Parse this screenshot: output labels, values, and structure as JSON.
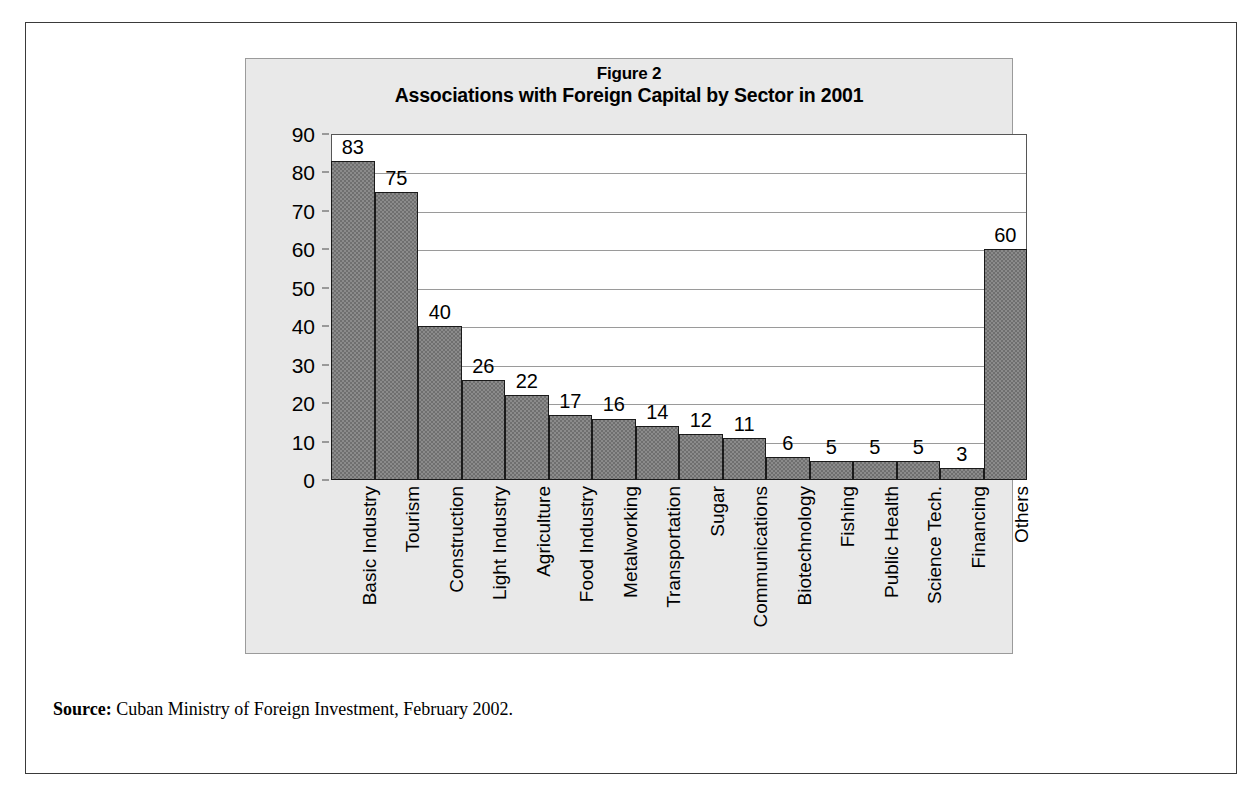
{
  "figure": {
    "number_label": "Figure 2",
    "title": "Associations with Foreign Capital by Sector in 2001"
  },
  "source": {
    "label": "Source:",
    "text": " Cuban Ministry of Foreign Investment, February 2002."
  },
  "colors": {
    "bar_fill": "#8b8b8b",
    "bar_stroke": "#1a1a1a",
    "panel_background": "#e9e9e9",
    "plot_background": "#ffffff",
    "gridline": "#9a9a9a",
    "frame": "#3a3a3a",
    "text": "#000000"
  },
  "chart_data": {
    "type": "bar",
    "title": "Associations with Foreign Capital by Sector in 2001",
    "subtitle": "Figure 2",
    "xlabel": "",
    "ylabel": "",
    "ylim": [
      0,
      90
    ],
    "ytick_step": 10,
    "yticks": [
      0,
      10,
      20,
      30,
      40,
      50,
      60,
      70,
      80,
      90
    ],
    "ytick_labels": [
      "0",
      "10",
      "20",
      "30",
      "40",
      "50",
      "60",
      "70",
      "80",
      "90"
    ],
    "grid": true,
    "grid_axis": "y",
    "legend": false,
    "legend_position": "none",
    "show_value_labels": true,
    "bar_gap": 0,
    "categories": [
      "Basic Industry",
      "Tourism",
      "Construction",
      "Light Industry",
      "Agriculture",
      "Food Industry",
      "Metalworking",
      "Transportation",
      "Sugar",
      "Communications",
      "Biotechnology",
      "Fishing",
      "Public Health",
      "Science Tech.",
      "Financing",
      "Others"
    ],
    "values": [
      83,
      75,
      40,
      26,
      22,
      17,
      16,
      14,
      12,
      11,
      6,
      5,
      5,
      5,
      3,
      60
    ],
    "value_labels": [
      "83",
      "75",
      "40",
      "26",
      "22",
      "17",
      "16",
      "14",
      "12",
      "11",
      "6",
      "5",
      "5",
      "5",
      "3",
      "60"
    ]
  }
}
